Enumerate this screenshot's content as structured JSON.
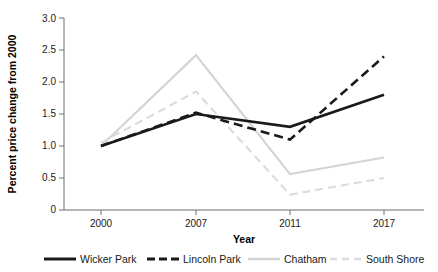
{
  "chart_data": {
    "type": "line",
    "title": "",
    "subtitle": "",
    "xlabel": "Year",
    "ylabel": "Percent price change from 2000",
    "categories": [
      "2000",
      "2007",
      "2011",
      "2017"
    ],
    "x": [
      2000,
      2007,
      2011,
      2017
    ],
    "xtick_labels": [
      "2000",
      "2007",
      "2011",
      "2017"
    ],
    "ytick_labels": [
      "0",
      "0.5",
      "1.0",
      "1.5",
      "2.0",
      "2.5",
      "3.0"
    ],
    "ytick_values": [
      0,
      0.5,
      1.0,
      1.5,
      2.0,
      2.5,
      3.0
    ],
    "ylim": [
      0,
      3.0
    ],
    "grid": false,
    "legend_position": "bottom",
    "series": [
      {
        "name": "Wicker Park",
        "values": [
          1.0,
          1.5,
          1.3,
          1.8
        ],
        "color": "#1a1a1a",
        "style": "solid",
        "width": 2.6,
        "dash": "none"
      },
      {
        "name": "Lincoln Park",
        "values": [
          1.0,
          1.52,
          1.1,
          2.4
        ],
        "color": "#1a1a1a",
        "style": "dashed",
        "width": 2.6,
        "dash": "9,5"
      },
      {
        "name": "Chatham",
        "values": [
          1.0,
          2.42,
          0.56,
          0.82
        ],
        "color": "#d4d4d4",
        "style": "solid",
        "width": 2.2,
        "dash": "none"
      },
      {
        "name": "South Shore",
        "values": [
          1.05,
          1.85,
          0.24,
          0.5
        ],
        "color": "#dcdcdc",
        "style": "dashed",
        "width": 2.2,
        "dash": "8,5"
      }
    ]
  },
  "legend": {
    "items": [
      {
        "label": "Wicker Park"
      },
      {
        "label": "Lincoln Park"
      },
      {
        "label": "Chatham"
      },
      {
        "label": "South Shore"
      }
    ]
  },
  "axes": {
    "y_title": "Percent price change from 2000",
    "x_title": "Year"
  }
}
